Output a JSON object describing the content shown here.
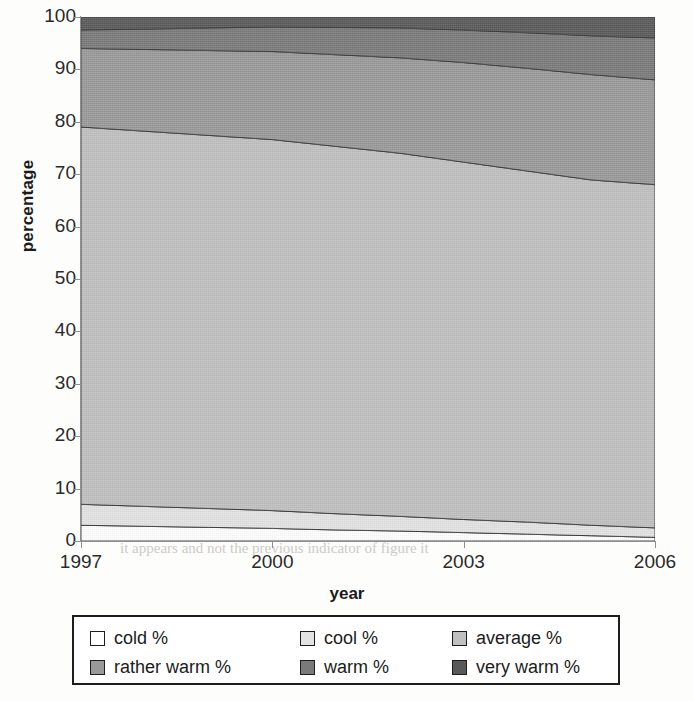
{
  "chart_data": {
    "type": "area",
    "stacked": true,
    "title": "",
    "xlabel": "year",
    "ylabel": "percentage",
    "x": [
      1997,
      1998,
      1999,
      2000,
      2001,
      2002,
      2003,
      2004,
      2005,
      2006
    ],
    "xtick_labels": [
      "1997",
      "2000",
      "2003",
      "2006"
    ],
    "xtick_values": [
      1997,
      2000,
      2003,
      2006
    ],
    "ytick_labels": [
      "0",
      "10",
      "20",
      "30",
      "40",
      "50",
      "60",
      "70",
      "80",
      "90",
      "100"
    ],
    "ylim": [
      0,
      100
    ],
    "xlim": [
      1997,
      2006
    ],
    "grid": false,
    "legend_position": "bottom",
    "series": [
      {
        "name": "cold %",
        "color": "#ffffff",
        "values": [
          3.0,
          2.8,
          2.6,
          2.4,
          2.1,
          1.9,
          1.6,
          1.3,
          1.0,
          0.7
        ]
      },
      {
        "name": "cool %",
        "color": "#e3e3e3",
        "values": [
          4.0,
          3.8,
          3.6,
          3.4,
          3.1,
          2.8,
          2.5,
          2.3,
          2.0,
          1.8
        ]
      },
      {
        "name": "average %",
        "color": "#c0c0c0",
        "values": [
          72.0,
          71.6,
          71.2,
          70.8,
          70.1,
          69.3,
          68.2,
          67.0,
          65.9,
          65.5
        ]
      },
      {
        "name": "rather warm %",
        "color": "#999999",
        "values": [
          15.0,
          15.6,
          16.2,
          16.8,
          17.5,
          18.2,
          19.0,
          19.6,
          20.1,
          20.0
        ]
      },
      {
        "name": "warm %",
        "color": "#7a7a7a",
        "values": [
          3.5,
          3.9,
          4.3,
          4.7,
          5.2,
          5.7,
          6.2,
          6.8,
          7.4,
          8.0
        ]
      },
      {
        "name": "very warm %",
        "color": "#595959",
        "values": [
          2.5,
          2.3,
          2.1,
          1.9,
          2.0,
          2.1,
          2.5,
          3.0,
          3.6,
          4.0
        ]
      }
    ],
    "cumulative_boundaries": {
      "note": "upper edge of each band, bottom to top, at each x",
      "cold": [
        3.0,
        2.8,
        2.6,
        2.4,
        2.1,
        1.9,
        1.6,
        1.3,
        1.0,
        0.7
      ],
      "cool": [
        7.0,
        6.6,
        6.2,
        5.8,
        5.2,
        4.7,
        4.1,
        3.6,
        3.0,
        2.5
      ],
      "average": [
        79.0,
        78.2,
        77.4,
        76.6,
        75.3,
        74.0,
        72.3,
        70.6,
        68.9,
        68.0
      ],
      "rather_warm": [
        94.0,
        93.8,
        93.6,
        93.4,
        92.8,
        92.2,
        91.3,
        90.2,
        89.0,
        88.0
      ],
      "warm": [
        97.5,
        97.7,
        97.9,
        98.1,
        98.0,
        97.9,
        97.5,
        97.0,
        96.4,
        96.0
      ],
      "very_warm": [
        100,
        100,
        100,
        100,
        100,
        100,
        100,
        100,
        100,
        100
      ]
    }
  },
  "legend": {
    "rows": [
      [
        {
          "label": "cold %",
          "color": "#ffffff",
          "icon": "legend-swatch-icon"
        },
        {
          "label": "cool %",
          "color": "#e3e3e3",
          "icon": "legend-swatch-icon"
        },
        {
          "label": "average %",
          "color": "#c0c0c0",
          "icon": "legend-swatch-icon"
        }
      ],
      [
        {
          "label": "rather warm %",
          "color": "#999999",
          "icon": "legend-swatch-icon"
        },
        {
          "label": "warm %",
          "color": "#7a7a7a",
          "icon": "legend-swatch-icon"
        },
        {
          "label": "very warm %",
          "color": "#595959",
          "icon": "legend-swatch-icon"
        }
      ]
    ]
  },
  "background_bleed": {
    "lines": [
      "in the interval",
      "sum of the",
      "to the top of the page and in the same",
      "it appears and not the previous indicator of figure it"
    ]
  }
}
